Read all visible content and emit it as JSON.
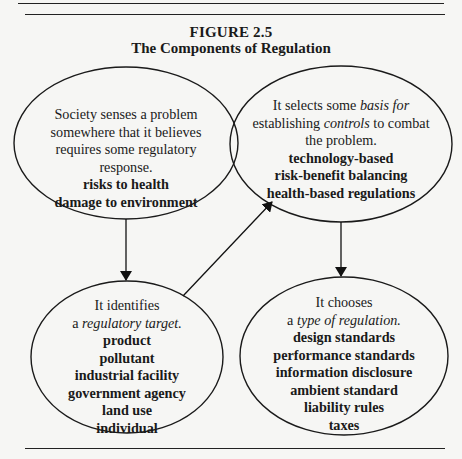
{
  "figure": {
    "number": "FIGURE 2.5",
    "title": "The Components of Regulation"
  },
  "nodes": {
    "problem": {
      "lines": [
        "Society senses a problem",
        "somewhere that it believes",
        "requires some regulatory",
        "response."
      ],
      "items": [
        "risks to health",
        "damage to environment"
      ]
    },
    "basis": {
      "line1_pre": "It selects some ",
      "line1_em": "basis for",
      "line2_pre": "establishing ",
      "line2_em": "controls",
      "line2_post": " to combat",
      "line3": "the problem.",
      "items": [
        "technology-based",
        "risk-benefit balancing",
        "health-based regulations"
      ]
    },
    "target": {
      "line1": "It identifies",
      "line2_pre": "a ",
      "line2_em": "regulatory target.",
      "items": [
        "product",
        "pollutant",
        "industrial facility",
        "government agency",
        "land use",
        "individual"
      ]
    },
    "type": {
      "line1": "It chooses",
      "line2_pre": "a ",
      "line2_em": "type of regulation.",
      "items": [
        "design standards",
        "performance standards",
        "information disclosure",
        "ambient standard",
        "liability rules",
        "taxes"
      ]
    }
  },
  "edges": [
    {
      "from": "problem",
      "to": "target"
    },
    {
      "from": "target",
      "to": "basis"
    },
    {
      "from": "basis",
      "to": "type"
    }
  ]
}
